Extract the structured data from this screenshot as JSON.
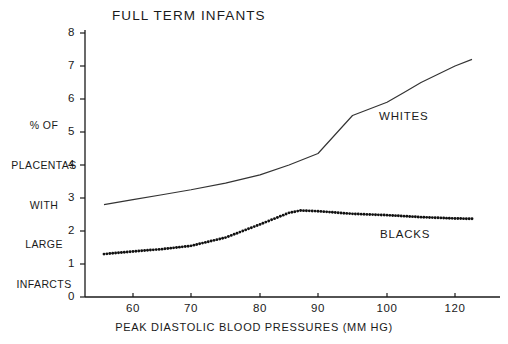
{
  "chart_data": {
    "type": "line",
    "title": "FULL TERM INFANTS",
    "xlabel": "PEAK DIASTOLIC BLOOD PRESSURES (MM HG)",
    "ylabel": "% OF PLACENTAS WITH LARGE INFARCTS",
    "ylabel_lines": [
      "% OF",
      "PLACENTAS",
      "WITH",
      "LARGE",
      "INFARCTS"
    ],
    "xlim": [
      55,
      126
    ],
    "ylim": [
      0,
      8
    ],
    "grid": false,
    "legend_position": "inline-right",
    "x_ticks": [
      {
        "value": 60,
        "label": "60",
        "px": 133
      },
      {
        "value": 70,
        "label": "70",
        "px": 191
      },
      {
        "value": 80,
        "label": "80",
        "px": 260
      },
      {
        "value": 90,
        "label": "90",
        "px": 318
      },
      {
        "value": 100,
        "label": "100",
        "px": 387
      },
      {
        "value": 120,
        "label": "120",
        "px": 455
      }
    ],
    "y_ticks": [
      {
        "value": 0,
        "label": "0"
      },
      {
        "value": 1,
        "label": "1"
      },
      {
        "value": 2,
        "label": "2"
      },
      {
        "value": 3,
        "label": "3"
      },
      {
        "value": 4,
        "label": "4"
      },
      {
        "value": 5,
        "label": "5"
      },
      {
        "value": 6,
        "label": "6"
      },
      {
        "value": 7,
        "label": "7"
      },
      {
        "value": 8,
        "label": "8"
      }
    ],
    "series": [
      {
        "name": "WHITES",
        "label": "WHITES",
        "style": "solid",
        "color": "#333333",
        "x": [
          55,
          60,
          65,
          70,
          75,
          80,
          85,
          90,
          95,
          100,
          105,
          110,
          115,
          120,
          125
        ],
        "values": [
          2.8,
          2.95,
          3.1,
          3.25,
          3.45,
          3.7,
          4.0,
          4.35,
          5.5,
          5.9,
          6.2,
          6.5,
          6.75,
          7.0,
          7.2
        ]
      },
      {
        "name": "BLACKS",
        "label": "BLACKS",
        "style": "dotted",
        "color": "#111111",
        "x": [
          55,
          60,
          65,
          70,
          75,
          80,
          85,
          87,
          90,
          95,
          100,
          105,
          110,
          115,
          120,
          125
        ],
        "values": [
          1.3,
          1.38,
          1.45,
          1.55,
          1.8,
          2.2,
          2.55,
          2.62,
          2.6,
          2.52,
          2.48,
          2.45,
          2.42,
          2.4,
          2.38,
          2.37
        ]
      }
    ]
  },
  "axes_geometry": {
    "x_axis_y_px": 297,
    "y_axis_x_px": 85,
    "plot_right_px": 498,
    "value8_y_px": 33,
    "value0_y_px": 297
  }
}
